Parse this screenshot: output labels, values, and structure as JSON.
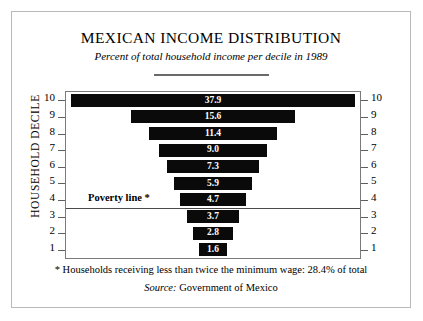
{
  "chart_data": {
    "type": "bar",
    "orientation": "horizontal-centered-funnel",
    "title": "MEXICAN INCOME DISTRIBUTION",
    "subtitle": "Percent of total household income per decile in 1989",
    "ylabel": "HOUSEHOLD DECILE",
    "xlabel": "",
    "categories": [
      "10",
      "9",
      "8",
      "7",
      "6",
      "5",
      "4",
      "3",
      "2",
      "1"
    ],
    "values": [
      37.9,
      15.6,
      11.4,
      9.0,
      7.3,
      5.9,
      4.7,
      3.7,
      2.8,
      1.6
    ],
    "value_labels": [
      "37.9",
      "15.6",
      "11.4",
      "9.0",
      "7.3",
      "5.9",
      "4.7",
      "3.7",
      "2.8",
      "1.6"
    ],
    "bar_widths_px": [
      284,
      164,
      128,
      108,
      92,
      78,
      66,
      52,
      40,
      28
    ],
    "left_axis_labels": [
      "10",
      "9",
      "8",
      "7",
      "6",
      "5",
      "4",
      "3",
      "2",
      "1"
    ],
    "right_axis_labels": [
      "10",
      "9",
      "8",
      "7",
      "6",
      "5",
      "4",
      "3",
      "2",
      "1"
    ],
    "grid": false,
    "legend": false,
    "bar_color": "#0a0a0a",
    "value_label_color": "#ffffff",
    "annotations": [
      {
        "name": "poverty-line",
        "label": "Poverty line *",
        "between_categories": [
          "4",
          "3"
        ]
      }
    ]
  },
  "footnote": "* Households receiving less than twice the minimum wage:  28.4% of total",
  "source": {
    "label": "Source:",
    "text": "Government of Mexico"
  }
}
